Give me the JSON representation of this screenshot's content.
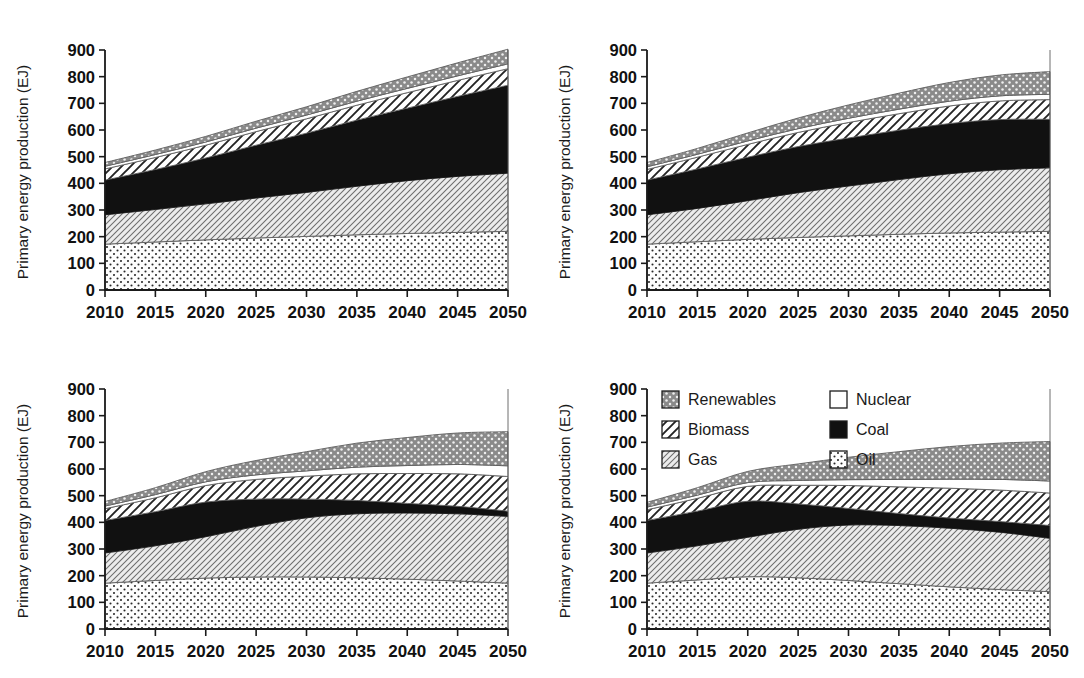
{
  "figure": {
    "panel_count": 4,
    "y_axis_title": "Primary energy production (EJ)",
    "y_ticks": [
      "0",
      "100",
      "200",
      "300",
      "400",
      "500",
      "600",
      "700",
      "800",
      "900"
    ],
    "x_ticks": [
      "2010",
      "2015",
      "2020",
      "2025",
      "2030",
      "2035",
      "2040",
      "2045",
      "2050"
    ]
  },
  "legend": {
    "position": "top-left of panel D",
    "items": [
      {
        "label": "Renewables",
        "pattern": "gray-dotted",
        "color": "#808080",
        "icon": "swatch-renewables-icon"
      },
      {
        "label": "Nuclear",
        "pattern": "white-solid",
        "color": "#ffffff",
        "icon": "swatch-nuclear-icon"
      },
      {
        "label": "Biomass",
        "pattern": "white-diagonal-thick",
        "color": "#ffffff",
        "icon": "swatch-biomass-icon"
      },
      {
        "label": "Coal",
        "pattern": "black-solid",
        "color": "#111111",
        "icon": "swatch-coal-icon"
      },
      {
        "label": "Gas",
        "pattern": "light-diagonal-fine",
        "color": "#e8e8e8",
        "icon": "swatch-gas-icon"
      },
      {
        "label": "Oil",
        "pattern": "white-dotted",
        "color": "#fafafa",
        "icon": "swatch-oil-icon"
      }
    ]
  },
  "chart_data": [
    {
      "type": "area",
      "id": "panel-a",
      "title": "",
      "xlabel": "",
      "ylabel": "Primary energy production (EJ)",
      "xlim": [
        2010,
        2050
      ],
      "ylim": [
        0,
        900
      ],
      "grid": false,
      "legend": false,
      "x": [
        2010,
        2015,
        2020,
        2025,
        2030,
        2035,
        2040,
        2045,
        2050
      ],
      "stack_order": [
        "Oil",
        "Gas",
        "Coal",
        "Biomass",
        "Nuclear",
        "Renewables"
      ],
      "series": [
        {
          "name": "Oil",
          "values": [
            172,
            180,
            188,
            195,
            201,
            207,
            212,
            216,
            220
          ]
        },
        {
          "name": "Gas",
          "values": [
            110,
            122,
            135,
            150,
            165,
            182,
            198,
            210,
            218
          ]
        },
        {
          "name": "Coal",
          "values": [
            130,
            150,
            172,
            198,
            222,
            248,
            272,
            300,
            330
          ]
        },
        {
          "name": "Biomass",
          "values": [
            42,
            45,
            48,
            51,
            54,
            56,
            58,
            60,
            62
          ]
        },
        {
          "name": "Nuclear",
          "values": [
            10,
            11,
            12,
            13,
            14,
            15,
            16,
            17,
            18
          ]
        },
        {
          "name": "Renewables",
          "values": [
            14,
            17,
            21,
            26,
            31,
            37,
            43,
            49,
            55
          ]
        }
      ],
      "totals": [
        478,
        525,
        576,
        633,
        687,
        745,
        799,
        852,
        903
      ]
    },
    {
      "type": "area",
      "id": "panel-b",
      "title": "",
      "xlabel": "",
      "ylabel": "Primary energy production (EJ)",
      "xlim": [
        2010,
        2050
      ],
      "ylim": [
        0,
        900
      ],
      "grid": false,
      "legend": false,
      "x": [
        2010,
        2015,
        2020,
        2025,
        2030,
        2035,
        2040,
        2045,
        2050
      ],
      "stack_order": [
        "Oil",
        "Gas",
        "Coal",
        "Biomass",
        "Nuclear",
        "Renewables"
      ],
      "series": [
        {
          "name": "Oil",
          "values": [
            172,
            181,
            190,
            197,
            203,
            209,
            214,
            217,
            220
          ]
        },
        {
          "name": "Gas",
          "values": [
            110,
            125,
            145,
            168,
            187,
            205,
            222,
            234,
            238
          ]
        },
        {
          "name": "Coal",
          "values": [
            130,
            148,
            163,
            173,
            180,
            185,
            188,
            188,
            182
          ]
        },
        {
          "name": "Biomass",
          "values": [
            40,
            44,
            48,
            53,
            58,
            62,
            66,
            70,
            74
          ]
        },
        {
          "name": "Nuclear",
          "values": [
            10,
            11,
            13,
            14,
            16,
            17,
            18,
            19,
            20
          ]
        },
        {
          "name": "Renewables",
          "values": [
            16,
            22,
            30,
            40,
            50,
            60,
            70,
            78,
            85
          ]
        }
      ],
      "totals": [
        478,
        531,
        589,
        645,
        694,
        738,
        778,
        806,
        819
      ]
    },
    {
      "type": "area",
      "id": "panel-c",
      "title": "",
      "xlabel": "",
      "ylabel": "Primary energy production (EJ)",
      "xlim": [
        2010,
        2050
      ],
      "ylim": [
        0,
        900
      ],
      "grid": false,
      "legend": false,
      "x": [
        2010,
        2015,
        2020,
        2025,
        2030,
        2035,
        2040,
        2045,
        2050
      ],
      "stack_order": [
        "Oil",
        "Gas",
        "Coal",
        "Biomass",
        "Nuclear",
        "Renewables"
      ],
      "series": [
        {
          "name": "Oil",
          "values": [
            172,
            182,
            191,
            195,
            195,
            192,
            187,
            180,
            172
          ]
        },
        {
          "name": "Gas",
          "values": [
            113,
            130,
            155,
            190,
            222,
            240,
            248,
            252,
            250
          ]
        },
        {
          "name": "Coal",
          "values": [
            122,
            128,
            130,
            102,
            70,
            50,
            36,
            28,
            20
          ]
        },
        {
          "name": "Biomass",
          "values": [
            44,
            52,
            62,
            74,
            86,
            100,
            112,
            122,
            130
          ]
        },
        {
          "name": "Nuclear",
          "values": [
            10,
            12,
            14,
            17,
            20,
            25,
            30,
            35,
            40
          ]
        },
        {
          "name": "Renewables",
          "values": [
            17,
            26,
            38,
            54,
            72,
            90,
            105,
            118,
            128
          ]
        }
      ],
      "totals": [
        478,
        530,
        590,
        632,
        665,
        697,
        718,
        735,
        740
      ]
    },
    {
      "type": "area",
      "id": "panel-d",
      "title": "",
      "xlabel": "",
      "ylabel": "Primary energy production (EJ)",
      "xlim": [
        2010,
        2050
      ],
      "ylim": [
        0,
        900
      ],
      "grid": false,
      "legend": true,
      "x": [
        2010,
        2015,
        2020,
        2025,
        2030,
        2035,
        2040,
        2045,
        2050
      ],
      "stack_order": [
        "Oil",
        "Gas",
        "Coal",
        "Biomass",
        "Nuclear",
        "Renewables"
      ],
      "series": [
        {
          "name": "Oil",
          "values": [
            172,
            184,
            196,
            192,
            182,
            170,
            158,
            148,
            140
          ]
        },
        {
          "name": "Gas",
          "values": [
            113,
            128,
            148,
            182,
            208,
            218,
            220,
            215,
            200
          ]
        },
        {
          "name": "Coal",
          "values": [
            122,
            130,
            135,
            95,
            62,
            45,
            38,
            40,
            48
          ]
        },
        {
          "name": "Biomass",
          "values": [
            40,
            48,
            56,
            70,
            86,
            100,
            112,
            118,
            122
          ]
        },
        {
          "name": "Nuclear",
          "values": [
            10,
            12,
            14,
            18,
            22,
            28,
            34,
            40,
            45
          ]
        },
        {
          "name": "Renewables",
          "values": [
            18,
            28,
            42,
            62,
            84,
            104,
            122,
            136,
            148
          ]
        }
      ],
      "totals": [
        475,
        530,
        591,
        619,
        644,
        665,
        684,
        697,
        703
      ]
    }
  ]
}
